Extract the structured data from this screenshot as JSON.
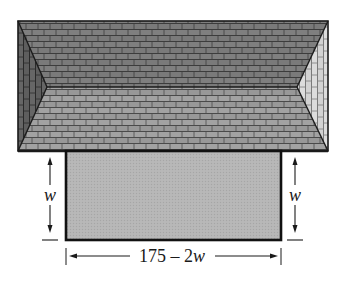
{
  "diagram": {
    "type": "roof-and-rectangle-dimension-figure",
    "roof": {
      "outline": {
        "x1": 18,
        "y1": 21,
        "x2": 328,
        "y2": 151
      },
      "ridge": {
        "left": [
          47,
          87
        ],
        "right": [
          297,
          87
        ]
      },
      "planes": {
        "upper": {
          "color": "#7a7a7a",
          "pattern": "horizontal-brick"
        },
        "lower": {
          "color": "#9c9c9c",
          "pattern": "horizontal-brick"
        },
        "left_hip": {
          "color": "#5e5e5e",
          "pattern": "vertical-brick"
        },
        "right_hip": {
          "color": "#d9d9d9",
          "pattern": "vertical-brick"
        }
      }
    },
    "rectangle": {
      "x": 66,
      "y": 151,
      "width": 215,
      "height": 89,
      "fill": "#b5b5b5",
      "stroke": "#111111"
    },
    "labels": {
      "left_side": "w",
      "right_side": "w",
      "bottom_prefix": "175 – 2",
      "bottom_var": "w"
    },
    "dimension_arrows": {
      "left": {
        "x": 50,
        "y_top": 158,
        "y_bottom": 232
      },
      "right": {
        "x": 295,
        "y_top": 158,
        "y_bottom": 232
      },
      "bottom": {
        "y": 257,
        "x_left": 66,
        "x_right": 281
      }
    }
  }
}
